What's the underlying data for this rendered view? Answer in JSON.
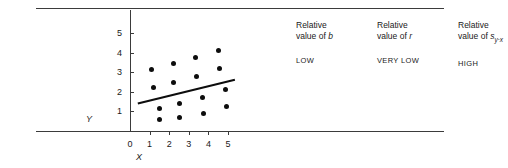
{
  "axes": {
    "x_title": "X",
    "y_title": "Y",
    "x_ticks": [
      "0",
      "1",
      "2",
      "3",
      "4",
      "5"
    ],
    "y_ticks": [
      "1",
      "2",
      "3",
      "4",
      "5"
    ]
  },
  "annotations": [
    {
      "head_line1": "Relative",
      "head_line2_prefix": "value of ",
      "symbol": "b",
      "subscript": "",
      "value": "LOW"
    },
    {
      "head_line1": "Relative",
      "head_line2_prefix": "value of ",
      "symbol": "r",
      "subscript": "",
      "value": "VERY LOW"
    },
    {
      "head_line1": "Relative",
      "head_line2_prefix": "value of ",
      "symbol": "s",
      "subscript": "y·x",
      "value": "HIGH"
    }
  ],
  "colors": {
    "ink": "#1a1a1a",
    "rule": "#3b3b3b",
    "marker": "#0d0d0d"
  },
  "chart_data": {
    "type": "scatter",
    "title": "",
    "xlabel": "X",
    "ylabel": "Y",
    "xlim": [
      0,
      5.6
    ],
    "ylim": [
      0,
      5.6
    ],
    "grid": false,
    "legend": null,
    "points": [
      {
        "x": 1.1,
        "y": 3.15
      },
      {
        "x": 1.2,
        "y": 2.2
      },
      {
        "x": 1.5,
        "y": 1.15
      },
      {
        "x": 1.5,
        "y": 0.6
      },
      {
        "x": 2.2,
        "y": 3.45
      },
      {
        "x": 2.2,
        "y": 2.5
      },
      {
        "x": 2.5,
        "y": 1.4
      },
      {
        "x": 2.55,
        "y": 0.7
      },
      {
        "x": 3.35,
        "y": 3.75
      },
      {
        "x": 3.4,
        "y": 2.8
      },
      {
        "x": 3.7,
        "y": 1.7
      },
      {
        "x": 3.75,
        "y": 0.9
      },
      {
        "x": 4.5,
        "y": 4.1
      },
      {
        "x": 4.55,
        "y": 3.2
      },
      {
        "x": 4.85,
        "y": 2.1
      },
      {
        "x": 4.9,
        "y": 1.25
      }
    ],
    "regression_line": {
      "x_start": 0.4,
      "y_start": 1.4,
      "x_end": 5.35,
      "y_end": 2.62
    }
  }
}
